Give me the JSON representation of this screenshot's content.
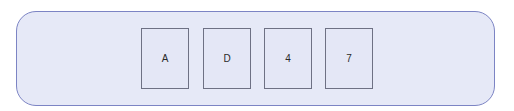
{
  "panel": {
    "background": "#e6e9f7",
    "border_color": "#7c84c4"
  },
  "cards": [
    {
      "label": "A"
    },
    {
      "label": "D"
    },
    {
      "label": "4"
    },
    {
      "label": "7"
    }
  ]
}
